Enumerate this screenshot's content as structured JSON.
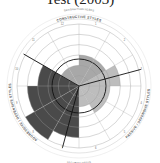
{
  "chart_data": {
    "type": "circumplex",
    "title": "Test (2003)",
    "rings": 6,
    "sectors": [
      {
        "n": 1,
        "name": "Humanistic-Encouraging",
        "group": "constructive",
        "value": 3
      },
      {
        "n": 2,
        "name": "Affiliative",
        "group": "constructive",
        "value": 3
      },
      {
        "n": 11,
        "name": "Achievement",
        "group": "constructive",
        "value": 2
      },
      {
        "n": 12,
        "name": "Self-Actualizing",
        "group": "constructive",
        "value": 2
      },
      {
        "n": 3,
        "name": "Approval",
        "group": "passive",
        "value": 4
      },
      {
        "n": 4,
        "name": "Conventional",
        "group": "passive",
        "value": 3
      },
      {
        "n": 5,
        "name": "Dependent",
        "group": "passive",
        "value": 3
      },
      {
        "n": 6,
        "name": "Avoidance",
        "group": "passive",
        "value": 2
      },
      {
        "n": 7,
        "name": "Oppositional",
        "group": "aggressive",
        "value": 5
      },
      {
        "n": 8,
        "name": "Power",
        "group": "aggressive",
        "value": 6
      },
      {
        "n": 9,
        "name": "Competitive",
        "group": "aggressive",
        "value": 5
      },
      {
        "n": 10,
        "name": "Perfectionistic",
        "group": "aggressive",
        "value": 4
      }
    ],
    "groups": {
      "constructive": {
        "label": "CONSTRUCTIVE STYLES",
        "color": "#a8a8a8"
      },
      "passive": {
        "label": "PASSIVE / DEFENSIVE STYLES",
        "color": "#bdbdbd"
      },
      "aggressive": {
        "label": "AGGRESSIVE / DEFENSIVE STYLES",
        "color": "#4a4a4a"
      }
    },
    "outer_labels": {
      "top": "SATISFACTION NEEDS",
      "bottom": "SECURITY NEEDS",
      "left": "TASK",
      "right": "PEOPLE"
    }
  }
}
